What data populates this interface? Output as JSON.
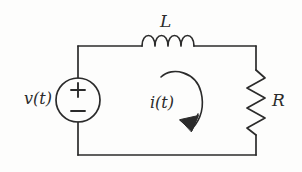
{
  "figure": {
    "type": "circuit-schematic",
    "background_color": "#fdfdfc",
    "line_color": "#2b2b2b",
    "width": 302,
    "height": 172
  },
  "labels": {
    "inductor": "L",
    "resistor": "R",
    "source": "v(t)",
    "current": "i(t)"
  },
  "components": {
    "voltage_source": {
      "name": "voltage-source",
      "label": "v(t)",
      "symbol": "circle-with-plus-minus",
      "polarity_top": "+",
      "polarity_bottom": "−",
      "center_x": 78,
      "center_y": 100,
      "radius": 22
    },
    "inductor": {
      "name": "inductor",
      "label": "L",
      "symbol": "coil",
      "coil_count": 4,
      "x_start": 142,
      "x_end": 196,
      "y": 46
    },
    "resistor": {
      "name": "resistor",
      "label": "R",
      "symbol": "zigzag",
      "zigzag_count": 6,
      "x": 256,
      "y_start": 70,
      "y_end": 135
    },
    "current_arrow": {
      "name": "current-loop-arrow",
      "label": "i(t)",
      "direction": "clockwise",
      "arrowhead_position": "bottom-right"
    }
  },
  "wires": {
    "top_left_corner": [
      78,
      46
    ],
    "top_right_corner": [
      256,
      46
    ],
    "bottom_left_corner": [
      78,
      155
    ],
    "bottom_right_corner": [
      256,
      155
    ]
  },
  "polarity_marks": {
    "plus": "+",
    "minus": "−"
  }
}
